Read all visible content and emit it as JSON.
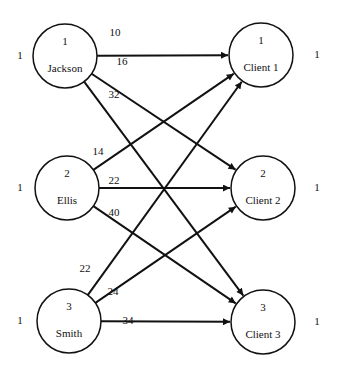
{
  "diagram": {
    "type": "bipartite-network",
    "sources": [
      {
        "id": "1",
        "name": "Jackson",
        "supply": "1",
        "cx": 65,
        "cy": 56
      },
      {
        "id": "2",
        "name": "Ellis",
        "supply": "1",
        "cx": 67,
        "cy": 188
      },
      {
        "id": "3",
        "name": "Smith",
        "supply": "1",
        "cx": 69,
        "cy": 321
      }
    ],
    "destinations": [
      {
        "id": "1",
        "name": "Client 1",
        "demand": "1",
        "cx": 261,
        "cy": 55
      },
      {
        "id": "2",
        "name": "Client 2",
        "demand": "1",
        "cx": 263,
        "cy": 188
      },
      {
        "id": "3",
        "name": "Client 3",
        "demand": "1",
        "cx": 263,
        "cy": 322
      }
    ],
    "edges": [
      {
        "from": "Jackson",
        "to": "Client 1",
        "cost": "10",
        "lx": 115,
        "ly": 36
      },
      {
        "from": "Jackson",
        "to": "Client 2",
        "cost": "16",
        "lx": 122,
        "ly": 65
      },
      {
        "from": "Jackson",
        "to": "Client 3",
        "cost": "32",
        "lx": 114,
        "ly": 98
      },
      {
        "from": "Ellis",
        "to": "Client 1",
        "cost": "14",
        "lx": 98,
        "ly": 155
      },
      {
        "from": "Ellis",
        "to": "Client 2",
        "cost": "22",
        "lx": 114,
        "ly": 184
      },
      {
        "from": "Ellis",
        "to": "Client 3",
        "cost": "40",
        "lx": 114,
        "ly": 216
      },
      {
        "from": "Smith",
        "to": "Client 1",
        "cost": "22",
        "lx": 85,
        "ly": 272
      },
      {
        "from": "Smith",
        "to": "Client 2",
        "cost": "24",
        "lx": 113,
        "ly": 295
      },
      {
        "from": "Smith",
        "to": "Client 3",
        "cost": "34",
        "lx": 128,
        "ly": 324
      }
    ],
    "node_radius": 32,
    "colors": {
      "stroke": "#111111",
      "background": "#ffffff"
    }
  }
}
